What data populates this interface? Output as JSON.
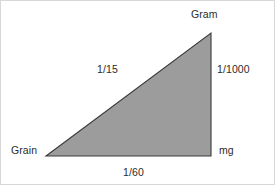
{
  "figure": {
    "background_color": "#ffffff",
    "border_color": "#d8d8d8",
    "shape": {
      "type": "right-triangle",
      "fill_color": "#9c9c9c",
      "stroke_color": "#3a3a3a",
      "stroke_width": 1,
      "vertices": {
        "bottom_left": [
          45,
          155
        ],
        "bottom_right": [
          210,
          155
        ],
        "top_right": [
          210,
          32
        ]
      }
    },
    "text_color": "#2b2b2b"
  },
  "labels": {
    "vertex_top": "Gram",
    "vertex_bottom_left": "Grain",
    "vertex_bottom_right": "mg",
    "edge_right": "1/1000",
    "edge_hypotenuse": "1/15",
    "edge_base": "1/60"
  },
  "chart_data": {
    "type": "diagram",
    "nodes": [
      {
        "id": "gram",
        "label": "Gram",
        "position": "top-right"
      },
      {
        "id": "grain",
        "label": "Grain",
        "position": "bottom-left"
      },
      {
        "id": "mg",
        "label": "mg",
        "position": "bottom-right"
      }
    ],
    "edges": [
      {
        "from": "grain",
        "to": "gram",
        "label": "1/15",
        "side": "hypotenuse"
      },
      {
        "from": "gram",
        "to": "mg",
        "label": "1/1000",
        "side": "right"
      },
      {
        "from": "grain",
        "to": "mg",
        "label": "1/60",
        "side": "base"
      }
    ]
  }
}
